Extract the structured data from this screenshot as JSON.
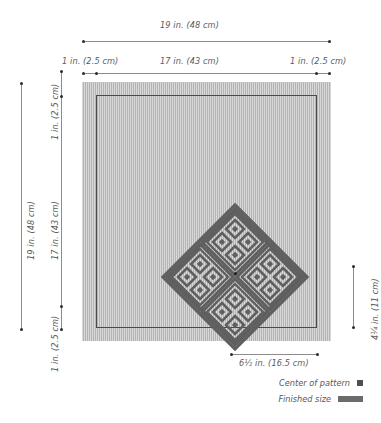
{
  "diagram": {
    "fabric_color": "#bdbdbd",
    "pattern_color": "#5f5f5f",
    "line_color": "#8c8c8c"
  },
  "dimensions": {
    "top_overall": "19 in. (48 cm)",
    "top_margin_left": "1 in. (2.5 cm)",
    "top_inner": "17 in. (43 cm)",
    "top_margin_right": "1 in. (2.5 cm)",
    "left_overall": "19 in. (48 cm)",
    "left_margin_top": "1 in. (2.5 cm)",
    "left_inner": "17 in. (43 cm)",
    "left_margin_bottom": "1 in. (2.5 cm)",
    "right_pattern_height": "4¼ in. (11 cm)",
    "bottom_pattern_width": "6½ in. (16.5 cm)"
  },
  "legend": {
    "center_of_pattern": "Center of pattern",
    "finished_size": "Finished size",
    "center_swatch": "filled-square-marker",
    "finished_swatch": "filled-bar-marker"
  }
}
